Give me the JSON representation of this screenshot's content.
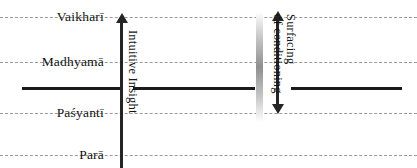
{
  "diagram": {
    "type": "axis-level-diagram",
    "width": 417,
    "height": 168,
    "background_color": "#ffffff",
    "levels": [
      {
        "id": "vaikhari",
        "label": "Vaikharī",
        "y": 17,
        "line_style": "dashed"
      },
      {
        "id": "madhyama",
        "label": "Madhyamā",
        "y": 62,
        "line_style": "dashed"
      },
      {
        "id": "pasyanti",
        "label": "Paśyantī",
        "y": 113,
        "line_style": "dashed"
      },
      {
        "id": "para",
        "label": "Parā",
        "y": 155,
        "line_style": "dashed"
      }
    ],
    "threshold_line": {
      "id": "threshold",
      "y": 87,
      "line_style": "solid",
      "color": "#1a1a1a",
      "thickness_px": 3
    },
    "arrows": [
      {
        "id": "intuitive-insight",
        "label_lines": [
          "Intuitive Insight"
        ],
        "direction": "up",
        "x": 121,
        "top_y": 14,
        "bottom_y": 168,
        "color": "#252525"
      },
      {
        "id": "surfacing-of-conditioning",
        "label_lines": [
          "Surfacing",
          "of conditioning"
        ],
        "direction": "both",
        "x": 277,
        "top_y": 12,
        "bottom_y": 113,
        "color": "#252525"
      }
    ],
    "gradient_band": {
      "id": "conditioning-gradient",
      "x": 258,
      "top_y": 12,
      "bottom_y": 120,
      "light_color": "#ffffff",
      "dark_color": "#8f8f8f"
    },
    "colors": {
      "text": "#141414",
      "dashed_line": "#9a9a9a",
      "solid_line": "#1a1a1a",
      "arrow": "#252525"
    }
  }
}
